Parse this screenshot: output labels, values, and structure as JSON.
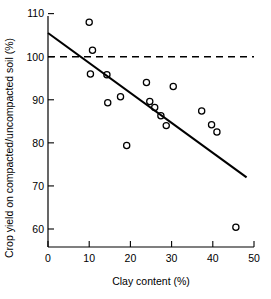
{
  "chart_data": {
    "type": "scatter",
    "title": "",
    "xlabel": "Clay content (%)",
    "ylabel": "Crop yield on compacted/uncompacted soil (%)",
    "xlim": [
      0,
      50
    ],
    "ylim": [
      55,
      110
    ],
    "grid": false,
    "legend": null,
    "xticks": [
      0,
      10,
      20,
      30,
      40,
      50
    ],
    "xtick_labels": [
      "0",
      "10",
      "20",
      "30",
      "40",
      "50"
    ],
    "yticks": [
      60,
      70,
      80,
      90,
      100,
      110
    ],
    "ytick_labels": [
      "60",
      "70",
      "80",
      "90",
      "100",
      "110"
    ],
    "marker": "open-circle",
    "points": [
      {
        "x": 10.0,
        "y": 108.0
      },
      {
        "x": 10.8,
        "y": 101.5
      },
      {
        "x": 10.3,
        "y": 96.0
      },
      {
        "x": 14.3,
        "y": 95.8
      },
      {
        "x": 14.5,
        "y": 89.3
      },
      {
        "x": 17.6,
        "y": 90.7
      },
      {
        "x": 19.1,
        "y": 79.4
      },
      {
        "x": 23.9,
        "y": 94.0
      },
      {
        "x": 24.7,
        "y": 89.6
      },
      {
        "x": 25.9,
        "y": 88.2
      },
      {
        "x": 27.4,
        "y": 86.3
      },
      {
        "x": 28.7,
        "y": 84.0
      },
      {
        "x": 30.4,
        "y": 93.1
      },
      {
        "x": 37.3,
        "y": 87.4
      },
      {
        "x": 39.7,
        "y": 84.2
      },
      {
        "x": 41.0,
        "y": 82.5
      },
      {
        "x": 45.6,
        "y": 60.4
      }
    ],
    "annotations": [
      {
        "type": "trend-line",
        "x0": 0,
        "y0": 105.5,
        "x1": 48.2,
        "y1": 72.0
      },
      {
        "type": "reference-line",
        "style": "dashed",
        "y": 100,
        "x0": 0,
        "x1": 50
      }
    ]
  }
}
